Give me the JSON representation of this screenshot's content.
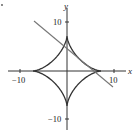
{
  "chart_data": {
    "type": "line",
    "title": "",
    "xlabel": "x",
    "ylabel": "y",
    "xlim": [
      -14,
      13
    ],
    "ylim": [
      -13,
      13
    ],
    "grid": false,
    "x_ticks": [
      -10,
      10
    ],
    "y_ticks": [
      10,
      -10
    ],
    "tick_labels": {
      "x_neg": "−10",
      "x_pos": "10",
      "y_pos": "10",
      "y_neg": "−10"
    },
    "series": [
      {
        "name": "astroid",
        "equation": "x^(2/3) + y^(2/3) = a^(2/3)",
        "a": 7.3,
        "cusps": [
          [
            7.3,
            0
          ],
          [
            0,
            7.3
          ],
          [
            -7.3,
            0
          ],
          [
            0,
            -7.3
          ]
        ],
        "color": "#333333"
      },
      {
        "name": "tangent-line",
        "points": [
          [
            -7.0,
            10.7
          ],
          [
            9.8,
            -3.4
          ]
        ],
        "color": "#777777"
      }
    ],
    "colors": {
      "axes": "#333333",
      "curve": "#333333",
      "tangent": "#777777"
    }
  },
  "labels": {
    "x_axis": "x",
    "y_axis": "y",
    "x_neg": "−10",
    "x_pos": "10",
    "y_pos": "10",
    "y_neg": "−10"
  }
}
